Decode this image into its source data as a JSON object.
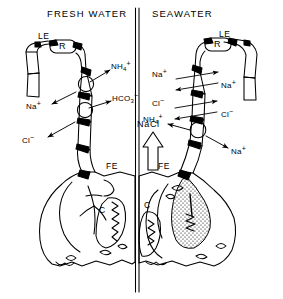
{
  "figure": {
    "type": "biological-diagram",
    "style": "black-and-white line art",
    "ink_color": "#000000",
    "background_color": "#ffffff"
  },
  "headers": {
    "left": "FRESH WATER",
    "right": "SEAWATER"
  },
  "divider": {
    "name": "center-divider",
    "style": "double vertical line",
    "x": 137,
    "top": 8,
    "bottom": 292
  },
  "left_panel": {
    "name": "fresh-water-panel",
    "epithelium_label": "LE",
    "junction_label": "R",
    "cell_label": "C",
    "filament_label": "FE",
    "transporters": [
      {
        "name": "apical-transporter-upper",
        "shape": "circle"
      },
      {
        "name": "apical-transporter-lower",
        "shape": "circle"
      }
    ],
    "ions": [
      {
        "name": "ammonium-efflux",
        "species": "NH",
        "sub": "4",
        "sup": "+",
        "direction": "out"
      },
      {
        "name": "bicarbonate-efflux",
        "species": "HCO",
        "sub": "3",
        "sup": "−",
        "direction": "out"
      },
      {
        "name": "sodium-influx",
        "species": "Na",
        "sub": "",
        "sup": "+",
        "direction": "in"
      },
      {
        "name": "chloride-influx",
        "species": "Cl",
        "sub": "",
        "sup": "−",
        "direction": "in"
      }
    ]
  },
  "right_panel": {
    "name": "seawater-panel",
    "epithelium_label": "LE",
    "junction_label": "R",
    "cell_label": "C",
    "filament_label": "FE",
    "bulk_flux_label": "NaCl",
    "transporters": [
      {
        "name": "basolateral-transporter",
        "shape": "circle"
      }
    ],
    "ions": [
      {
        "name": "sodium-paracellular-left",
        "species": "Na",
        "sub": "",
        "sup": "+",
        "direction": "paracellular"
      },
      {
        "name": "sodium-paracellular-right",
        "species": "Na",
        "sub": "",
        "sup": "+",
        "direction": "paracellular"
      },
      {
        "name": "chloride-paracellular-left",
        "species": "Cl",
        "sub": "",
        "sup": "−",
        "direction": "paracellular"
      },
      {
        "name": "chloride-paracellular-right",
        "species": "Cl",
        "sub": "",
        "sup": "−",
        "direction": "paracellular"
      },
      {
        "name": "ammonium-efflux",
        "species": "NH",
        "sub": "4",
        "sup": "+",
        "direction": "out"
      },
      {
        "name": "sodium-efflux",
        "species": "Na",
        "sub": "",
        "sup": "+",
        "direction": "out"
      }
    ]
  }
}
